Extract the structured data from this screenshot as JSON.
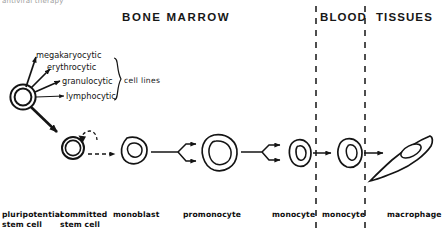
{
  "figure": {
    "clipped_caption": "antiviral therapy",
    "regions": [
      {
        "id": "bone-marrow",
        "label": "BONE MARROW"
      },
      {
        "id": "blood",
        "label": "BLOOD"
      },
      {
        "id": "tissues",
        "label": "TISSUES"
      }
    ],
    "cell_lines": {
      "bracket_label": "cell lines",
      "items": [
        {
          "id": "megakaryocytic",
          "label": "megakaryocytic"
        },
        {
          "id": "erythrocytic",
          "label": "erythrocytic"
        },
        {
          "id": "granulocytic",
          "label": "granulocytic"
        },
        {
          "id": "lymphocytic",
          "label": "lymphocytic"
        }
      ]
    },
    "stages": [
      {
        "id": "pluripotential-stem-cell",
        "line1": "pluripotential",
        "line2": "stem cell"
      },
      {
        "id": "committed-stem-cell",
        "line1": "committed",
        "line2": "stem cell"
      },
      {
        "id": "monoblast",
        "line1": "monoblast",
        "line2": ""
      },
      {
        "id": "promonocyte",
        "line1": "promonocyte",
        "line2": ""
      },
      {
        "id": "monocyte-marrow",
        "line1": "monocyte",
        "line2": ""
      },
      {
        "id": "monocyte-blood",
        "line1": "monocyte",
        "line2": ""
      },
      {
        "id": "macrophage",
        "line1": "macrophage",
        "line2": ""
      }
    ],
    "colors": {
      "ink": "#141414",
      "background": "#ffffff",
      "faded_caption": "#8d8d8d"
    }
  }
}
